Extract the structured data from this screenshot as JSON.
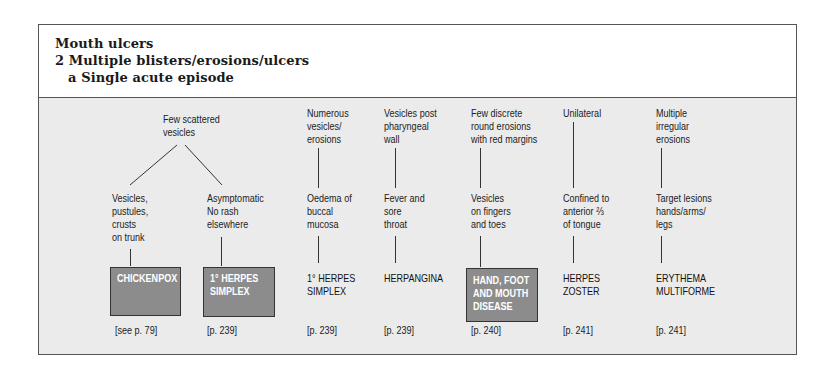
{
  "header": {
    "title": "Mouth ulcers",
    "subtitle": "2 Multiple blisters/erosions/ulcers",
    "section": "a Single acute episode"
  },
  "columns": [
    {
      "top": "Few scattered\nvesicles",
      "branches": [
        {
          "mid": "Vesicles,\npustules,\ncrusts\non trunk",
          "diagnosis": "CHICKENPOX",
          "highlighted": true,
          "ref": "[see p. 79]"
        },
        {
          "mid": "Asymptomatic\nNo rash\nelsewhere",
          "diagnosis": "1° HERPES\nSIMPLEX",
          "highlighted": true,
          "ref": "[p. 239]"
        }
      ]
    },
    {
      "top": "Numerous\nvesicles/\nerosions",
      "mid": "Oedema of\nbuccal\nmucosa",
      "diagnosis": "1° HERPES\nSIMPLEX",
      "highlighted": false,
      "ref": "[p. 239]"
    },
    {
      "top": "Vesicles post\npharyngeal\nwall",
      "mid": "Fever and\nsore\nthroat",
      "diagnosis": "HERPANGINA",
      "highlighted": false,
      "ref": "[p. 239]"
    },
    {
      "top": "Few discrete\nround erosions\nwith red margins",
      "mid": "Vesicles\non fingers\nand toes",
      "diagnosis": "HAND, FOOT\nAND MOUTH\nDISEASE",
      "highlighted": true,
      "ref": "[p. 240]"
    },
    {
      "top": "Unilateral",
      "mid": "Confined to\nanterior ⅔\nof tongue",
      "diagnosis": "HERPES\nZOSTER",
      "highlighted": false,
      "ref": "[p. 241]"
    },
    {
      "top": "Multiple\nirregular\nerosions",
      "mid": "Target lesions\nhands/arms/\nlegs",
      "diagnosis": "ERYTHEMA\nMULTIFORME",
      "highlighted": false,
      "ref": "[p. 241]"
    }
  ],
  "colors": {
    "panel_bg": "#ebebeb",
    "highlight_box": "#8c8c8c",
    "highlight_text": "#ffffff",
    "border": "#555555"
  }
}
